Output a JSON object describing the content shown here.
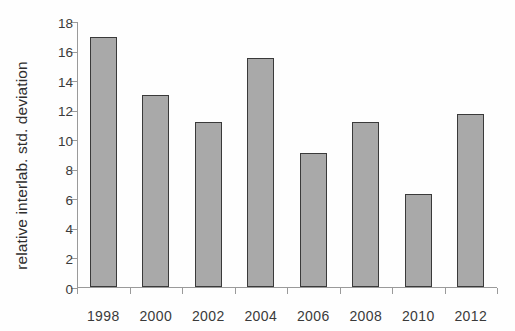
{
  "chart_data": {
    "type": "bar",
    "title": "",
    "xlabel": "",
    "ylabel": "relative interlab. std. deviation",
    "categories": [
      "1998",
      "2000",
      "2002",
      "2004",
      "2006",
      "2008",
      "2010",
      "2012"
    ],
    "values": [
      16.9,
      13.0,
      11.2,
      15.5,
      9.1,
      11.2,
      6.3,
      11.7
    ],
    "ylim": [
      0,
      18
    ],
    "ytick_labels": [
      "0",
      "2",
      "4",
      "6",
      "8",
      "10",
      "12",
      "14",
      "16",
      "18"
    ],
    "ytick_values": [
      0,
      2,
      4,
      6,
      8,
      10,
      12,
      14,
      16,
      18
    ],
    "grid": false,
    "legend": false,
    "legend_position": "none",
    "bar_fill_color": "#a9a9a9",
    "bar_edge_color": "#3a3a3a",
    "axis_color": "#9a9a9a",
    "background_color": "#ffffff"
  }
}
